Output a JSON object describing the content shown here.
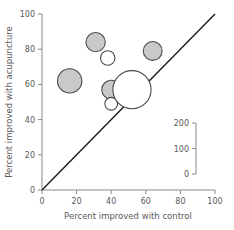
{
  "chart_data": {
    "type": "scatter",
    "title": "",
    "xlabel": "Percent improved with control",
    "ylabel": "Percent improved with acupuncture",
    "xlim": [
      0,
      100
    ],
    "ylim": [
      0,
      100
    ],
    "xticks": [
      "0",
      "20",
      "40",
      "60",
      "80",
      "100"
    ],
    "yticks": [
      "0",
      "20",
      "40",
      "60",
      "80",
      "100"
    ],
    "xtick_values": [
      0,
      20,
      40,
      60,
      80,
      100
    ],
    "ytick_values": [
      0,
      20,
      40,
      60,
      80,
      100
    ],
    "grid": false,
    "legend_position": "lower-right",
    "annotations": [
      "identity line y = x"
    ],
    "reference_line": {
      "name": "identity",
      "from": [
        0,
        0
      ],
      "to": [
        100,
        100
      ]
    },
    "size_legend": {
      "title": "",
      "ticks": [
        "200",
        "100",
        "0"
      ],
      "tick_values": [
        200,
        100,
        0
      ],
      "encodes": "study sample size"
    },
    "points": [
      {
        "label": "study-1",
        "x": 16,
        "y": 62,
        "size": 175,
        "style": "filled"
      },
      {
        "label": "study-2",
        "x": 31,
        "y": 84,
        "size": 110,
        "style": "filled"
      },
      {
        "label": "study-3",
        "x": 38,
        "y": 75,
        "size": 62,
        "style": "open"
      },
      {
        "label": "study-4",
        "x": 64,
        "y": 79,
        "size": 105,
        "style": "filled"
      },
      {
        "label": "study-5",
        "x": 40,
        "y": 57,
        "size": 105,
        "style": "filled"
      },
      {
        "label": "study-6",
        "x": 57,
        "y": 58,
        "size": 100,
        "style": "filled"
      },
      {
        "label": "study-7",
        "x": 51,
        "y": 55,
        "size": 60,
        "style": "open"
      },
      {
        "label": "study-8",
        "x": 40,
        "y": 49,
        "size": 48,
        "style": "open"
      },
      {
        "label": "study-9",
        "x": 52,
        "y": 57,
        "size": 430,
        "style": "open"
      }
    ]
  },
  "colors": {
    "bubble_fill": "#c9c9c9",
    "bubble_stroke": "#4a4a4a",
    "axis": "#8a8a8a",
    "identity_line": "#1a1a1a",
    "text": "#5a5a5a",
    "background": "#ffffff"
  }
}
